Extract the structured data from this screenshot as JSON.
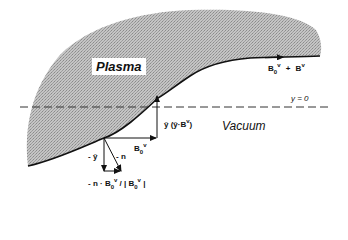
{
  "figure": {
    "regions": {
      "plasma": "Plasma",
      "vacuum": "Vacuum"
    },
    "reference_line": {
      "label": "y = 0",
      "style": "dashed"
    },
    "vectors": {
      "boundary_field": {
        "label_main": "B",
        "sub": "0",
        "sup": "v",
        "plus": "+",
        "label_b": "B",
        "sup_b": "v"
      },
      "horizontal": {
        "label": "B",
        "sub": "0",
        "sup": "v"
      },
      "vertical": {
        "label": "ŷ (ŷ·B",
        "sup": "v",
        "close": ")"
      },
      "minus_y": {
        "label": "- ŷ"
      },
      "minus_n": {
        "label": "- n"
      },
      "projection": {
        "label": "- n · B",
        "sub": "0",
        "sup": "v",
        "div": " / | B",
        "sub2": "0",
        "sup2": "v",
        "close": " |"
      }
    },
    "colors": {
      "plasma_fill": "#b8b8b8",
      "line": "#111111",
      "background": "#ffffff"
    }
  }
}
